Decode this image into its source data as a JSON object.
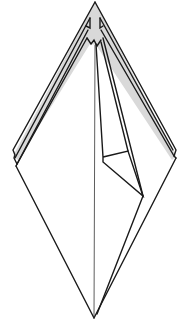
{
  "diagram": {
    "kind": "origami-fold-step",
    "colors": {
      "background": "#ffffff",
      "stroke": "#1a1a1a",
      "shade": "#d9d9d9",
      "centerline": "#333333"
    },
    "vertices": {
      "top_apex": [
        95,
        2
      ],
      "bottom_point": [
        94,
        318
      ],
      "left_corner": [
        16,
        166
      ],
      "right_corner": [
        176,
        158
      ]
    },
    "layers": {
      "left_flap_edges": 4,
      "right_flap_edges": 3,
      "inner_fold_flap": true,
      "center_crease": true
    }
  }
}
